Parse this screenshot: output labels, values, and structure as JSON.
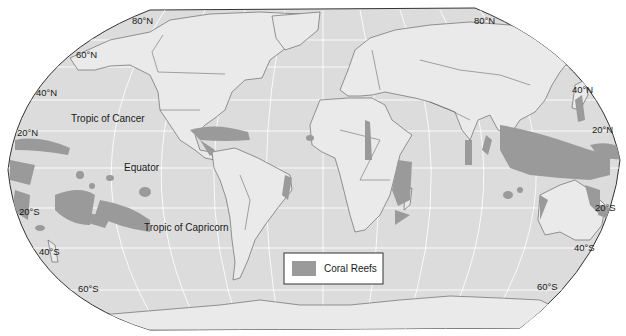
{
  "map": {
    "title": "Coral Reefs of the World",
    "projection": "Robinson",
    "colors": {
      "ocean": "#dcdcdc",
      "land": "#eaeaea",
      "coral_reef": "#9a9a9a",
      "borders": "#555555",
      "graticule": "#ffffff"
    },
    "latitude_labels_left": [
      "80°N",
      "60°N",
      "40°N",
      "20°N",
      "20°S",
      "40°S",
      "60°S"
    ],
    "latitude_labels_right": [
      "80°N",
      "40°N",
      "20°N",
      "20°S",
      "40°S",
      "60°S"
    ],
    "special_lines": {
      "tropic_of_cancer": "Tropic of Cancer",
      "equator": "Equator",
      "tropic_of_capricorn": "Tropic of Capricorn"
    },
    "legend": {
      "items": [
        {
          "label": "Coral Reefs",
          "color": "#9a9a9a"
        }
      ]
    }
  }
}
